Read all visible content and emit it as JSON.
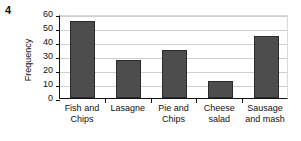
{
  "question_number": "4",
  "chart_data": {
    "type": "bar",
    "title": "",
    "xlabel": "",
    "ylabel": "Frequency",
    "categories": [
      "Fish and Chips",
      "Lasagne",
      "Pie and Chips",
      "Cheese salad",
      "Sausage and mash"
    ],
    "category_lines": [
      [
        "Fish and",
        "Chips"
      ],
      [
        "Lasagne",
        ""
      ],
      [
        "Pie and",
        "Chips"
      ],
      [
        "Cheese",
        "salad"
      ],
      [
        "Sausage",
        "and mash"
      ]
    ],
    "values": [
      55,
      27,
      34.5,
      12,
      44
    ],
    "ylim": [
      0,
      60
    ],
    "ytick_labels": [
      "0",
      "10",
      "20",
      "30",
      "40",
      "50",
      "60"
    ],
    "ytick_values": [
      0,
      10,
      20,
      30,
      40,
      50,
      60
    ],
    "grid": true,
    "legend": false,
    "bar_color": "#4d4d4d",
    "bar_border_color": "#2b2b2b",
    "axis_color": "#111111",
    "grid_color": "#cfcfcf"
  }
}
